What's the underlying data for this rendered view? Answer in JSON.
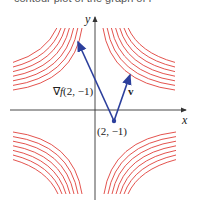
{
  "header_cutoff_text": "contour plot of the graph of f",
  "axes": {
    "x_label": "x",
    "y_label": "y",
    "origin_px": [
      95,
      110
    ]
  },
  "point": {
    "label": "(2, −1)",
    "px": [
      114,
      121
    ]
  },
  "vectors": [
    {
      "name": "gradient",
      "label_prefix": "∇",
      "label_f": "f",
      "label_args": "(2, −1)",
      "tip_px": [
        77,
        40
      ]
    },
    {
      "name": "v",
      "label": "v",
      "tip_px": [
        131,
        73
      ]
    }
  ],
  "colors": {
    "contour": "#e0403a",
    "vector": "#2c3f9c",
    "axis": "#333333"
  },
  "contours": {
    "count_per_quadrant": 7,
    "function": "xy = c"
  }
}
